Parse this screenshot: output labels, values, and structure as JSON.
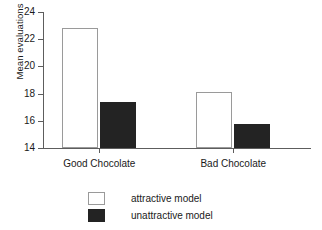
{
  "chart_data": {
    "type": "bar",
    "title": "",
    "xlabel": "",
    "ylabel": "Mean evaluations",
    "ylim": [
      14,
      24
    ],
    "yticks": [
      24,
      22,
      20,
      18,
      16,
      14
    ],
    "ytick_labels": [
      "24",
      "22",
      "20",
      "18",
      "16",
      "14"
    ],
    "grid": false,
    "legend_position": "bottom-center",
    "categories": [
      "Good Chocolate",
      "Bad Chocolate"
    ],
    "series": [
      {
        "name": "attractive model",
        "color": "#ffffff",
        "edge_color": "#9a9a9a",
        "values": [
          22.8,
          18.1
        ]
      },
      {
        "name": "unattractive model",
        "color": "#232323",
        "edge_color": "#232323",
        "values": [
          17.4,
          15.8
        ]
      }
    ]
  },
  "legend": {
    "items": [
      {
        "label": "attractive model",
        "style": "light"
      },
      {
        "label": "unattractive model",
        "style": "dark"
      }
    ]
  },
  "colors": {
    "axis": "#5d5d5d",
    "text": "#1a1a1a",
    "background": "#ffffff",
    "bar_light": "#ffffff",
    "bar_dark": "#232323"
  }
}
